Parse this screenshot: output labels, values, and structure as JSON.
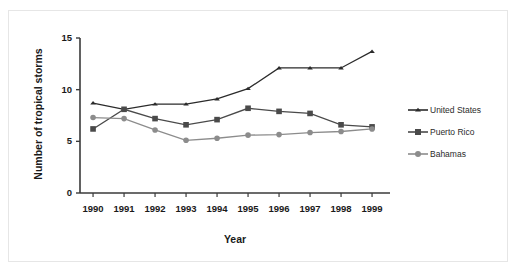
{
  "chart_data": {
    "type": "line",
    "title": "",
    "xlabel": "Year",
    "ylabel": "Number of tropical storms",
    "categories": [
      "1990",
      "1991",
      "1992",
      "1993",
      "1994",
      "1995",
      "1996",
      "1997",
      "1998",
      "1999"
    ],
    "x": [
      1990,
      1991,
      1992,
      1993,
      1994,
      1995,
      1996,
      1997,
      1998,
      1999
    ],
    "ylim": [
      0,
      15
    ],
    "yticks": [
      0,
      5,
      10,
      15
    ],
    "ytick_labels": [
      "0",
      "5",
      "10",
      "15"
    ],
    "grid": false,
    "legend_position": "right",
    "series": [
      {
        "name": "United States",
        "marker": "triangle",
        "color": "#2b2b2b",
        "values": [
          8.7,
          8.1,
          8.6,
          8.6,
          9.1,
          10.1,
          12.1,
          12.1,
          12.1,
          13.7
        ]
      },
      {
        "name": "Puerto Rico",
        "marker": "square",
        "color": "#4a4a4a",
        "values": [
          6.2,
          8.1,
          7.2,
          6.6,
          7.1,
          8.2,
          7.9,
          7.7,
          6.6,
          6.4
        ]
      },
      {
        "name": "Bahamas",
        "marker": "circle",
        "color": "#8c8c8c",
        "values": [
          7.3,
          7.2,
          6.1,
          5.1,
          5.3,
          5.6,
          5.65,
          5.85,
          5.95,
          6.2
        ]
      }
    ]
  },
  "legend": {
    "items": [
      {
        "label": "United States"
      },
      {
        "label": "Puerto Rico"
      },
      {
        "label": "Bahamas"
      }
    ]
  },
  "colors": {
    "united_states": "#2b2b2b",
    "puerto_rico": "#4a4a4a",
    "bahamas": "#8c8c8c",
    "axis": "#3a3a3a",
    "frame": "#e6e6e6"
  }
}
